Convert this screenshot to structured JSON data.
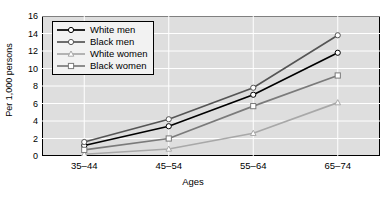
{
  "chart_data": {
    "type": "line",
    "title": "",
    "xlabel": "Ages",
    "ylabel": "Per 1,000 persons",
    "categories": [
      "35–44",
      "45–54",
      "55–64",
      "65–74"
    ],
    "ylim": [
      0,
      16
    ],
    "yticks": [
      0,
      2,
      4,
      6,
      8,
      10,
      12,
      14,
      16
    ],
    "ytick_labels": [
      "0",
      "2",
      "4",
      "6",
      "8",
      "10",
      "12",
      "14",
      "16"
    ],
    "grid": true,
    "grid_color": "#ffffff",
    "plot_background": "#dedede",
    "legend_position": "top-left",
    "series": [
      {
        "name": "White men",
        "values": [
          1.2,
          3.4,
          7.0,
          11.8
        ],
        "color": "#000000",
        "marker": "circle"
      },
      {
        "name": "Black men",
        "values": [
          1.6,
          4.2,
          7.8,
          13.8
        ],
        "color": "#555555",
        "marker": "circle"
      },
      {
        "name": "White women",
        "values": [
          0.2,
          0.8,
          2.6,
          6.1
        ],
        "color": "#a8a8a8",
        "marker": "triangle"
      },
      {
        "name": "Black women",
        "values": [
          0.7,
          2.0,
          5.7,
          9.2
        ],
        "color": "#7a7a7a",
        "marker": "square"
      }
    ]
  }
}
